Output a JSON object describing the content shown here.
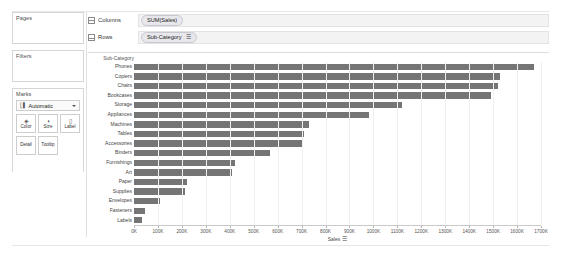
{
  "left_panel": {
    "pages": {
      "title": "Pages"
    },
    "filters": {
      "title": "Filters"
    },
    "marks": {
      "title": "Marks",
      "mark_type": "Automatic",
      "mark_type_icon": "bar-chart-icon",
      "caret_icon": "chevron-down-icon",
      "buttons": [
        {
          "label": "Color",
          "icon": "color-palette-icon",
          "glyph": "⚘"
        },
        {
          "label": "Size",
          "icon": "size-icon",
          "glyph": "◔"
        },
        {
          "label": "Label",
          "icon": "label-icon",
          "glyph": "☰"
        },
        {
          "label": "Detail",
          "icon": "detail-icon",
          "glyph": ""
        },
        {
          "label": "Tooltip",
          "icon": "tooltip-icon",
          "glyph": ""
        }
      ]
    }
  },
  "shelves": {
    "columns": {
      "label": "Columns",
      "icon": "columns-icon",
      "pills": [
        {
          "text": "SUM(Sales)",
          "sorted": false
        }
      ]
    },
    "rows": {
      "label": "Rows",
      "icon": "rows-icon",
      "pills": [
        {
          "text": "Sub-Category",
          "sorted": true,
          "sort_icon": "sort-descending-icon",
          "sort_glyph": "☰"
        }
      ]
    }
  },
  "chart_data": {
    "type": "bar",
    "orientation": "horizontal",
    "title": "",
    "row_header": "Sub-Category",
    "xlabel": "Sales",
    "ylabel": "Sub-Category",
    "xlim": [
      0,
      1700000
    ],
    "grid": true,
    "legend": "none",
    "bar_color": "#757575",
    "tick_labels": [
      "0K",
      "100K",
      "200K",
      "300K",
      "400K",
      "500K",
      "600K",
      "700K",
      "800K",
      "900K",
      "1000K",
      "1100K",
      "1200K",
      "1300K",
      "1400K",
      "1500K",
      "1600K",
      "1700K"
    ],
    "tick_values": [
      0,
      100000,
      200000,
      300000,
      400000,
      500000,
      600000,
      700000,
      800000,
      900000,
      1000000,
      1100000,
      1200000,
      1300000,
      1400000,
      1500000,
      1600000,
      1700000
    ],
    "categories": [
      "Phones",
      "Copiers",
      "Chairs",
      "Bookcases",
      "Storage",
      "Appliances",
      "Machines",
      "Tables",
      "Accessories",
      "Binders",
      "Furnishings",
      "Art",
      "Paper",
      "Supplies",
      "Envelopes",
      "Fasteners",
      "Labels"
    ],
    "values": [
      1670000,
      1530000,
      1520000,
      1490000,
      1120000,
      980000,
      730000,
      710000,
      700000,
      570000,
      420000,
      410000,
      220000,
      215000,
      110000,
      45000,
      35000
    ],
    "axis_title_sort_icon": "sort-descending-icon",
    "axis_title_sort_glyph": "☰"
  }
}
